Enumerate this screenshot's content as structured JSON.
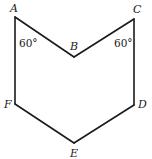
{
  "figure": {
    "type": "hexagon",
    "vertices": [
      {
        "id": "A",
        "label": "A"
      },
      {
        "id": "B",
        "label": "B"
      },
      {
        "id": "C",
        "label": "C"
      },
      {
        "id": "D",
        "label": "D"
      },
      {
        "id": "E",
        "label": "E"
      },
      {
        "id": "F",
        "label": "F"
      }
    ],
    "edges": [
      [
        "A",
        "B"
      ],
      [
        "B",
        "C"
      ],
      [
        "C",
        "D"
      ],
      [
        "D",
        "E"
      ],
      [
        "E",
        "F"
      ],
      [
        "F",
        "A"
      ]
    ],
    "angles": [
      {
        "at": "A",
        "label": "60°"
      },
      {
        "at": "C",
        "label": "60°"
      }
    ]
  }
}
